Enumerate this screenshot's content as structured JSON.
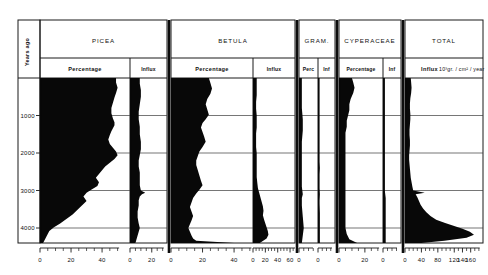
{
  "figure": {
    "type": "pollen-percentage-influx-diagram",
    "depth_axis_label": "Years ago",
    "depth_ticks": [
      "1000",
      "2000",
      "3000",
      "4000"
    ],
    "depth_tick_values": [
      1000,
      2000,
      3000,
      4000
    ],
    "depth_range": [
      0,
      4400
    ]
  },
  "panels": [
    {
      "taxon": "PICEA",
      "subpanels": [
        {
          "kind": "Percentage",
          "label": "Percentage",
          "axis_labels": [
            "0",
            "20",
            "40"
          ],
          "axis_values": [
            0,
            20,
            40
          ],
          "xmax": 58
        },
        {
          "kind": "Influx",
          "label": "Influx",
          "axis_labels": [
            "0",
            "20"
          ],
          "axis_values": [
            0,
            20
          ],
          "xmax": 34
        }
      ]
    },
    {
      "taxon": "BETULA",
      "subpanels": [
        {
          "kind": "Percentage",
          "label": "Percentage",
          "axis_labels": [
            "0",
            "20",
            "40"
          ],
          "axis_values": [
            0,
            20,
            40
          ],
          "xmax": 52
        },
        {
          "kind": "Influx",
          "label": "Influx",
          "axis_labels": [
            "0",
            "20",
            "40",
            "60"
          ],
          "axis_values": [
            0,
            20,
            40,
            60
          ],
          "xmax": 68
        }
      ]
    },
    {
      "taxon": "GRAM.",
      "subpanels": [
        {
          "kind": "Percentage",
          "label": "Perc",
          "axis_labels": [
            "0"
          ],
          "axis_values": [
            0
          ],
          "xmax": 20
        },
        {
          "kind": "Influx",
          "label": "Inf",
          "axis_labels": [
            "0"
          ],
          "axis_values": [
            0
          ],
          "xmax": 20
        }
      ]
    },
    {
      "taxon": "CYPERACEAE",
      "subpanels": [
        {
          "kind": "Percentage",
          "label": "Percentage",
          "axis_labels": [
            "0",
            "20"
          ],
          "axis_values": [
            0,
            20
          ],
          "xmax": 34
        },
        {
          "kind": "Influx",
          "label": "Inf",
          "axis_labels": [
            "0"
          ],
          "axis_values": [
            0
          ],
          "xmax": 20
        }
      ]
    },
    {
      "taxon": "TOTAL",
      "subpanels": [
        {
          "kind": "Influx",
          "label": "Influx",
          "units": "10³gr. / cm² / year",
          "axis_labels": [
            "0",
            "40",
            "80",
            "120",
            "140",
            "160"
          ],
          "axis_values": [
            0,
            40,
            80,
            120,
            140,
            160
          ],
          "xmax": 190
        }
      ]
    }
  ],
  "chart_data": {
    "type": "area",
    "title": "",
    "xlabel": "",
    "ylabel": "Years ago",
    "ylim": [
      4400,
      0
    ],
    "grid": true,
    "legend_position": "none",
    "orientation": "horizontal-area-vs-depth",
    "series": [
      {
        "name": "PICEA Percentage",
        "panel": "PICEA",
        "kind": "Percentage",
        "xlim": [
          0,
          58
        ],
        "y": [
          0,
          120,
          260,
          400,
          520,
          660,
          800,
          940,
          1080,
          1180,
          1260,
          1340,
          1420,
          1520,
          1640,
          1760,
          1860,
          1960,
          2060,
          2160,
          2260,
          2360,
          2460,
          2560,
          2660,
          2780,
          2880,
          2980,
          3060,
          3160,
          3280,
          3400,
          3520,
          3640,
          3760,
          3880,
          3980,
          4080,
          4160,
          4240,
          4320,
          4400
        ],
        "values": [
          49,
          49,
          50,
          49,
          48,
          47,
          46,
          46,
          47,
          48,
          48,
          47,
          46,
          45,
          44,
          45,
          47,
          49,
          50,
          48,
          45,
          42,
          40,
          38,
          36,
          38,
          37,
          33,
          30,
          28,
          30,
          27,
          24,
          21,
          17,
          13,
          9,
          6,
          5,
          4,
          3,
          2
        ]
      },
      {
        "name": "PICEA Influx",
        "panel": "PICEA",
        "kind": "Influx",
        "xlim": [
          0,
          34
        ],
        "y": [
          0,
          150,
          320,
          500,
          700,
          900,
          1100,
          1300,
          1500,
          1700,
          1900,
          2050,
          2200,
          2360,
          2520,
          2700,
          2860,
          3000,
          3060,
          3100,
          3160,
          3260,
          3400,
          3560,
          3720,
          3880,
          4000,
          4100,
          4200,
          4300,
          4400
        ],
        "values": [
          9,
          9,
          10,
          10,
          9,
          8,
          8,
          9,
          9,
          10,
          10,
          9,
          8,
          8,
          9,
          9,
          9,
          10,
          14,
          11,
          9,
          8,
          8,
          7,
          7,
          8,
          9,
          8,
          7,
          6,
          5
        ]
      },
      {
        "name": "BETULA Percentage",
        "panel": "BETULA",
        "kind": "Percentage",
        "xlim": [
          0,
          52
        ],
        "y": [
          0,
          130,
          280,
          420,
          560,
          700,
          840,
          980,
          1100,
          1200,
          1320,
          1440,
          1560,
          1700,
          1840,
          1960,
          2080,
          2200,
          2320,
          2460,
          2600,
          2740,
          2860,
          2980,
          3080,
          3200,
          3320,
          3440,
          3560,
          3680,
          3800,
          3900,
          4000,
          4100,
          4200,
          4280,
          4340,
          4400
        ],
        "values": [
          24,
          25,
          26,
          25,
          23,
          22,
          23,
          24,
          22,
          20,
          19,
          20,
          21,
          22,
          20,
          18,
          17,
          16,
          16,
          17,
          18,
          19,
          20,
          18,
          16,
          14,
          13,
          12,
          13,
          14,
          13,
          12,
          11,
          12,
          13,
          14,
          16,
          40
        ]
      },
      {
        "name": "BETULA Influx",
        "panel": "BETULA",
        "kind": "Influx",
        "xlim": [
          0,
          68
        ],
        "y": [
          0,
          140,
          300,
          460,
          640,
          820,
          1000,
          1160,
          1320,
          1480,
          1660,
          1840,
          2000,
          2160,
          2320,
          2480,
          2640,
          2800,
          2940,
          3060,
          3180,
          3300,
          3420,
          3540,
          3660,
          3780,
          3880,
          3980,
          4080,
          4180,
          4280,
          4400
        ],
        "values": [
          6,
          6,
          6,
          6,
          5,
          5,
          6,
          6,
          6,
          5,
          5,
          5,
          6,
          6,
          6,
          6,
          6,
          7,
          8,
          10,
          12,
          14,
          16,
          17,
          16,
          18,
          20,
          22,
          24,
          25,
          22,
          11
        ]
      },
      {
        "name": "GRAM. Percentage",
        "panel": "GRAM.",
        "kind": "Percentage",
        "xlim": [
          0,
          20
        ],
        "y": [
          0,
          200,
          500,
          800,
          1100,
          1400,
          1700,
          2000,
          2300,
          2600,
          2900,
          3100,
          3200,
          3400,
          3700,
          4000,
          4200,
          4400
        ],
        "values": [
          3,
          3,
          3,
          3,
          4,
          4,
          3,
          3,
          3,
          3,
          3,
          4,
          3,
          3,
          4,
          5,
          4,
          3
        ]
      },
      {
        "name": "GRAM. Influx",
        "panel": "GRAM.",
        "kind": "Influx",
        "xlim": [
          0,
          20
        ],
        "y": [
          0,
          300,
          700,
          1100,
          1500,
          1900,
          2200,
          2400,
          2600,
          2900,
          3100,
          3300,
          3600,
          3900,
          4100,
          4400
        ],
        "values": [
          1,
          1,
          1,
          1,
          1,
          1,
          1,
          2,
          1,
          1,
          2,
          1,
          2,
          2,
          2,
          2
        ]
      },
      {
        "name": "CYPERACEAE Percentage",
        "panel": "CYPERACEAE",
        "kind": "Percentage",
        "xlim": [
          0,
          34
        ],
        "y": [
          0,
          120,
          260,
          400,
          560,
          700,
          860,
          1000,
          1140,
          1300,
          1460,
          1620,
          1800,
          1980,
          2160,
          2340,
          2520,
          2700,
          2880,
          3040,
          3200,
          3360,
          3520,
          3680,
          3840,
          4000,
          4160,
          4300,
          4400
        ],
        "values": [
          10,
          11,
          12,
          11,
          9,
          8,
          8,
          7,
          6,
          6,
          5,
          5,
          5,
          5,
          5,
          5,
          5,
          5,
          5,
          5,
          5,
          5,
          5,
          5,
          5,
          5,
          6,
          8,
          14
        ]
      },
      {
        "name": "CYPERACEAE Influx",
        "panel": "CYPERACEAE",
        "kind": "Influx",
        "xlim": [
          0,
          20
        ],
        "y": [
          0,
          300,
          700,
          1100,
          1500,
          1900,
          2300,
          2700,
          3000,
          3200,
          3500,
          3800,
          4100,
          4400
        ],
        "values": [
          2,
          2,
          2,
          2,
          2,
          2,
          2,
          2,
          2,
          3,
          3,
          3,
          3,
          3
        ]
      },
      {
        "name": "TOTAL Influx",
        "panel": "TOTAL",
        "kind": "Influx",
        "xlim": [
          0,
          190
        ],
        "y": [
          0,
          120,
          260,
          400,
          540,
          680,
          820,
          960,
          1100,
          1240,
          1380,
          1520,
          1660,
          1800,
          1940,
          2060,
          2180,
          2300,
          2420,
          2540,
          2660,
          2780,
          2900,
          3000,
          3060,
          3100,
          3180,
          3280,
          3380,
          3480,
          3580,
          3680,
          3780,
          3860,
          3940,
          4020,
          4100,
          4180,
          4260,
          4340,
          4400
        ],
        "values": [
          14,
          15,
          16,
          15,
          13,
          12,
          12,
          13,
          13,
          12,
          11,
          11,
          12,
          12,
          11,
          10,
          10,
          11,
          12,
          13,
          14,
          16,
          18,
          20,
          48,
          26,
          30,
          34,
          38,
          44,
          52,
          62,
          76,
          96,
          118,
          140,
          158,
          168,
          150,
          96,
          40
        ]
      }
    ]
  }
}
